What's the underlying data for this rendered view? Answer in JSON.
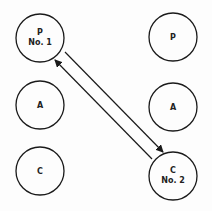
{
  "nodes": [
    {
      "id": "p1",
      "label_line1": "P",
      "label_line2": "No. 1",
      "cx": 40,
      "cy": 38
    },
    {
      "id": "a_left",
      "label_line1": "A",
      "label_line2": "",
      "cx": 40,
      "cy": 105
    },
    {
      "id": "c_left",
      "label_line1": "C",
      "label_line2": "",
      "cx": 40,
      "cy": 171
    },
    {
      "id": "p_right",
      "label_line1": "P",
      "label_line2": "",
      "cx": 173,
      "cy": 37
    },
    {
      "id": "a_right",
      "label_line1": "A",
      "label_line2": "",
      "cx": 173,
      "cy": 107
    },
    {
      "id": "c2",
      "label_line1": "C",
      "label_line2": "No. 2",
      "cx": 173,
      "cy": 176
    }
  ],
  "arrows": [
    {
      "from": "c2",
      "to": "p1",
      "direction": "to-p1"
    },
    {
      "from": "p1",
      "to": "c2",
      "direction": "to-c2"
    }
  ],
  "colors": {
    "stroke": "#1a1a1a",
    "background": "#fdfdfd"
  }
}
